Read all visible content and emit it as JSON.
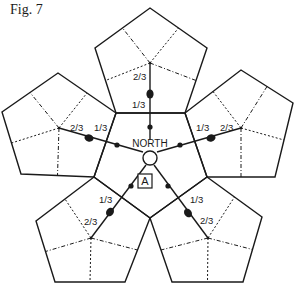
{
  "figure": {
    "label": "Fig. 7",
    "center_label": "NORTH",
    "marker_label": "A",
    "colors": {
      "stroke": "#1a1a1a",
      "background": "#ffffff"
    }
  },
  "center": {
    "x": 150,
    "y": 158,
    "r": 7
  },
  "central_pentagon": [
    [
      116,
      113
    ],
    [
      185,
      113
    ],
    [
      207,
      177
    ],
    [
      150,
      218
    ],
    [
      94,
      177
    ]
  ],
  "pentagons": [
    {
      "name": "top",
      "vertices": [
        [
          116,
          113
        ],
        [
          95,
          48
        ],
        [
          150,
          8
        ],
        [
          207,
          48
        ],
        [
          185,
          113
        ]
      ],
      "hub": [
        150,
        63
      ],
      "spoke_inner": [
        150,
        140
      ],
      "small_dot": [
        150,
        127
      ],
      "big_dot": [
        150,
        94
      ],
      "label_13": {
        "text": "1/3",
        "x": 132,
        "y": 108
      },
      "label_23": {
        "text": "2/3",
        "x": 133,
        "y": 80
      }
    },
    {
      "name": "right",
      "vertices": [
        [
          185,
          113
        ],
        [
          241,
          70
        ],
        [
          293,
          103
        ],
        [
          275,
          177
        ],
        [
          207,
          177
        ]
      ],
      "hub": [
        241,
        128
      ],
      "spoke_inner": [
        157,
        152
      ],
      "small_dot": [
        180,
        145
      ],
      "big_dot": [
        211,
        138
      ],
      "label_13": {
        "text": "1/3",
        "x": 196,
        "y": 131
      },
      "label_23": {
        "text": "2/3",
        "x": 220,
        "y": 131
      }
    },
    {
      "name": "left",
      "vertices": [
        [
          116,
          113
        ],
        [
          58,
          73
        ],
        [
          2,
          112
        ],
        [
          21,
          174
        ],
        [
          94,
          177
        ]
      ],
      "hub": [
        59,
        128
      ],
      "spoke_inner": [
        143,
        152
      ],
      "small_dot": [
        117,
        145
      ],
      "big_dot": [
        89,
        138
      ],
      "label_13": {
        "text": "1/3",
        "x": 94,
        "y": 131
      },
      "label_23": {
        "text": "2/3",
        "x": 70,
        "y": 131
      }
    },
    {
      "name": "bottom-left",
      "vertices": [
        [
          94,
          177
        ],
        [
          36,
          221
        ],
        [
          55,
          282
        ],
        [
          125,
          282
        ],
        [
          150,
          218
        ]
      ],
      "hub": [
        91,
        238
      ],
      "spoke_inner": [
        146,
        165
      ],
      "small_dot": [
        131,
        186
      ],
      "big_dot": [
        110,
        212
      ],
      "label_13": {
        "text": "1/3",
        "x": 99,
        "y": 203
      },
      "label_23": {
        "text": "2/3",
        "x": 84,
        "y": 225
      }
    },
    {
      "name": "bottom-right",
      "vertices": [
        [
          207,
          177
        ],
        [
          262,
          217
        ],
        [
          243,
          282
        ],
        [
          172,
          282
        ],
        [
          150,
          218
        ]
      ],
      "hub": [
        208,
        238
      ],
      "spoke_inner": [
        154,
        165
      ],
      "small_dot": [
        168,
        186
      ],
      "big_dot": [
        188,
        213
      ],
      "label_13": {
        "text": "1/3",
        "x": 190,
        "y": 203
      },
      "label_23": {
        "text": "2/3",
        "x": 200,
        "y": 224
      }
    }
  ],
  "marker_box": {
    "x": 138,
    "y": 174,
    "w": 14,
    "h": 14
  },
  "north_label_pos": {
    "x": 150,
    "y": 147
  }
}
